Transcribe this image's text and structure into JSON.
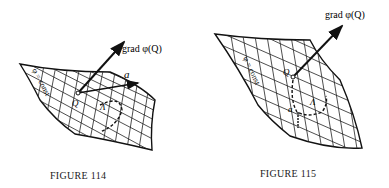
{
  "figures": [
    {
      "caption": "FIGURE 114",
      "labels": {
        "vector_grad": "grad φ(Q)",
        "vector_a": "a",
        "surface": "φ = const",
        "point": "Q",
        "curve": "Λ"
      }
    },
    {
      "caption": "FIGURE 115",
      "labels": {
        "vector_grad": "grad φ(Q)",
        "surface": "φ = const",
        "point": "Q",
        "curve": "Λ",
        "vector_a": "a"
      }
    }
  ]
}
